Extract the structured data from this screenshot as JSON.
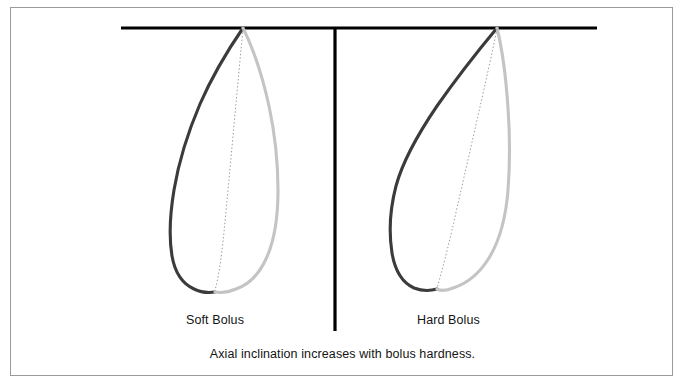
{
  "figure": {
    "caption": "Axial inclination increases with bolus hardness.",
    "panels": [
      {
        "id": "soft",
        "label": "Soft Bolus",
        "axis_inclination_degrees": 6,
        "apex": {
          "x": 243,
          "y": 28
        },
        "root_tip": {
          "x": 215,
          "y": 290
        }
      },
      {
        "id": "hard",
        "label": "Hard Bolus",
        "axis_inclination_degrees": 13,
        "apex": {
          "x": 497,
          "y": 28
        },
        "root_tip": {
          "x": 437,
          "y": 286
        }
      }
    ],
    "reference_line": {
      "name": "occlusal-plane",
      "x_start": 121,
      "x_end": 597,
      "y": 28
    },
    "divider_line": {
      "name": "panel-divider",
      "x": 335,
      "y_start": 28,
      "y_end": 331
    },
    "colors": {
      "outline_dark": "#3b3b3b",
      "outline_light": "#c4c4c4",
      "reference_line": "#000000",
      "divider_line": "#000000",
      "axis_dotted": "#999999",
      "frame_border": "#9a9a9a",
      "text": "#141414",
      "background": "#ffffff"
    }
  }
}
